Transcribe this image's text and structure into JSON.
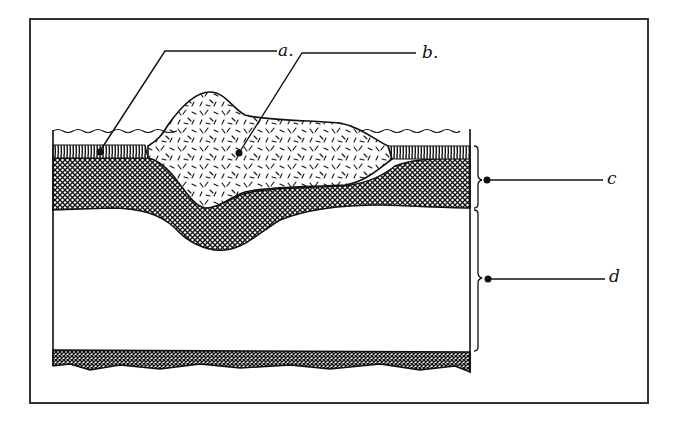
{
  "diagram": {
    "type": "geological cross-section (hand-drawn)",
    "labels": {
      "a": "a.",
      "b": "b.",
      "c": "c",
      "d": "d"
    },
    "colors": {
      "ink": "#111111",
      "background": "#ffffff",
      "frame": "#333333"
    },
    "layers": [
      {
        "id": "water",
        "description": "wavy water surface line"
      },
      {
        "id": "a",
        "description": "thin vertically-striped top layer (pointer dot)"
      },
      {
        "id": "b",
        "description": "mound of dashed/speckled material intruding into layers"
      },
      {
        "id": "c",
        "description": "cross-hatched layer, bracketed"
      },
      {
        "id": "d",
        "description": "blank white layer, bracketed"
      },
      {
        "id": "base",
        "description": "dark hatched base band"
      }
    ]
  }
}
